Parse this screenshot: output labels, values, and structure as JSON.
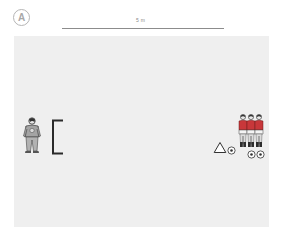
{
  "diagram": {
    "badge_label": "A",
    "scale": {
      "label": "5 m"
    },
    "field": {
      "color": "#efefef"
    },
    "elements": [
      {
        "type": "goalkeeper",
        "side": "left"
      },
      {
        "type": "goal",
        "side": "left"
      },
      {
        "type": "cone",
        "side": "right"
      },
      {
        "type": "ball",
        "count": 3,
        "side": "right"
      },
      {
        "type": "field-player",
        "count": 3,
        "shirt_color": "#c8373a",
        "side": "right"
      }
    ]
  },
  "colors": {
    "shirt": "#c8373a",
    "goalkeeper": "#9a9a9a",
    "outline": "#333333"
  }
}
